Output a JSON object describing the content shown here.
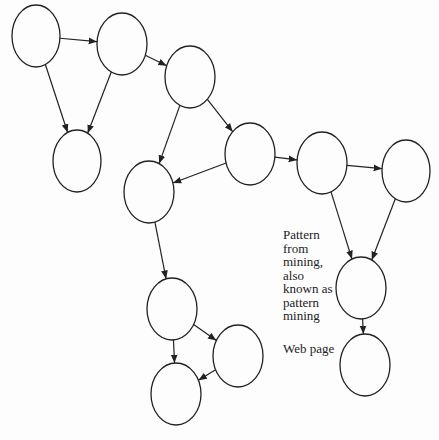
{
  "diagram": {
    "nodes": [
      {
        "id": "n1",
        "cx": 36,
        "cy": 36,
        "rx": 24,
        "ry": 31
      },
      {
        "id": "n2",
        "cx": 122,
        "cy": 44,
        "rx": 25,
        "ry": 31
      },
      {
        "id": "n3",
        "cx": 190,
        "cy": 77,
        "rx": 25,
        "ry": 31
      },
      {
        "id": "n4",
        "cx": 77,
        "cy": 161,
        "rx": 24,
        "ry": 31
      },
      {
        "id": "n5",
        "cx": 149,
        "cy": 192,
        "rx": 25,
        "ry": 31
      },
      {
        "id": "n6",
        "cx": 250,
        "cy": 154,
        "rx": 25,
        "ry": 31
      },
      {
        "id": "n7",
        "cx": 322,
        "cy": 163,
        "rx": 25,
        "ry": 31
      },
      {
        "id": "n8",
        "cx": 406,
        "cy": 171,
        "rx": 24,
        "ry": 31
      },
      {
        "id": "n9",
        "cx": 361,
        "cy": 288,
        "rx": 25,
        "ry": 31
      },
      {
        "id": "n10",
        "cx": 365,
        "cy": 365,
        "rx": 25,
        "ry": 31
      },
      {
        "id": "n11",
        "cx": 172,
        "cy": 309,
        "rx": 25,
        "ry": 31
      },
      {
        "id": "n12",
        "cx": 238,
        "cy": 356,
        "rx": 25,
        "ry": 31
      },
      {
        "id": "n13",
        "cx": 176,
        "cy": 394,
        "rx": 25,
        "ry": 31
      }
    ],
    "edges": [
      {
        "from": "n1",
        "to": "n2"
      },
      {
        "from": "n1",
        "to": "n4"
      },
      {
        "from": "n2",
        "to": "n4"
      },
      {
        "from": "n2",
        "to": "n3"
      },
      {
        "from": "n3",
        "to": "n5"
      },
      {
        "from": "n3",
        "to": "n6"
      },
      {
        "from": "n6",
        "to": "n5"
      },
      {
        "from": "n6",
        "to": "n7"
      },
      {
        "from": "n7",
        "to": "n8"
      },
      {
        "from": "n7",
        "to": "n9"
      },
      {
        "from": "n8",
        "to": "n9"
      },
      {
        "from": "n9",
        "to": "n10"
      },
      {
        "from": "n5",
        "to": "n11"
      },
      {
        "from": "n11",
        "to": "n13"
      },
      {
        "from": "n11",
        "to": "n12"
      },
      {
        "from": "n12",
        "to": "n13"
      }
    ],
    "labels": {
      "pattern": [
        "Pattern",
        "from",
        "mining,",
        "also",
        "known as",
        "pattern",
        "mining"
      ],
      "webpage": "Web page"
    },
    "stroke_color": "#222222"
  }
}
